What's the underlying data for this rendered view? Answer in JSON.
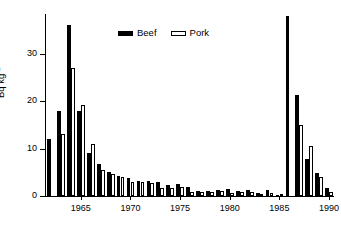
{
  "chart_data": {
    "type": "bar",
    "title": "",
    "subtitle": "",
    "xlabel": "",
    "ylabel": "Bq kg",
    "ylabel_exponent": "-1",
    "ylabel_full": "Bq kg-1",
    "grid": false,
    "legend_position": "top-center",
    "xlim": [
      1961.5,
      1990.5
    ],
    "ylim": [
      0,
      38.5
    ],
    "yticks": [
      0,
      10,
      20,
      30
    ],
    "ytick_labels": [
      "0",
      "10",
      "20",
      "30"
    ],
    "xticks": [
      1965,
      1970,
      1975,
      1980,
      1985,
      1990
    ],
    "xtick_labels": [
      "1965",
      "1970",
      "1975",
      "1980",
      "1985",
      "1990"
    ],
    "categories": [
      1962,
      1963,
      1964,
      1965,
      1966,
      1967,
      1968,
      1969,
      1970,
      1971,
      1972,
      1973,
      1974,
      1975,
      1976,
      1977,
      1978,
      1979,
      1980,
      1981,
      1982,
      1983,
      1984,
      1985,
      1986,
      1987,
      1988,
      1989,
      1990
    ],
    "series": [
      {
        "name": "Beef",
        "color": "#000000",
        "values": [
          12.0,
          18.0,
          36.2,
          18.0,
          9.0,
          6.8,
          5.0,
          4.3,
          3.9,
          3.2,
          3.1,
          3.0,
          2.3,
          2.6,
          2.0,
          1.1,
          1.1,
          1.2,
          1.4,
          1.1,
          1.3,
          0.6,
          1.2,
          0.2,
          38.0,
          21.3,
          7.8,
          4.8,
          1.7
        ]
      },
      {
        "name": "Pork",
        "color": "#ffffff",
        "values": [
          0.0,
          13.2,
          27.0,
          19.3,
          11.0,
          5.5,
          4.7,
          4.1,
          3.0,
          2.9,
          2.7,
          1.8,
          1.7,
          2.0,
          0.9,
          0.9,
          0.8,
          1.0,
          0.7,
          0.8,
          0.9,
          0.5,
          0.6,
          0.2,
          0.0,
          15.0,
          10.5,
          4.1,
          0.8
        ]
      }
    ]
  },
  "legend": {
    "entries": [
      {
        "label": "Beef",
        "swatch": "filled-black-bar-icon"
      },
      {
        "label": "Pork",
        "swatch": "outlined-white-bar-icon"
      }
    ]
  }
}
